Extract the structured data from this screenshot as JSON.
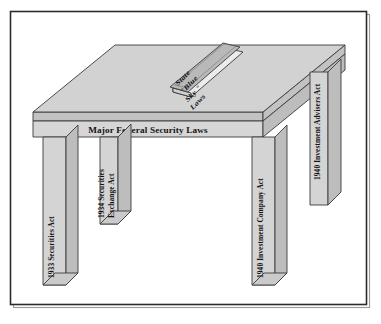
{
  "figure": {
    "title": "Major Federal Security Laws",
    "caption_on_apron": "Major Federal Security Laws",
    "book": {
      "name": "state-blue-sky-laws-book",
      "lines": [
        "State",
        "\"Blue",
        "Sky \"",
        "Laws"
      ],
      "full_text": "State \"Blue Sky\" Laws"
    },
    "legs": [
      {
        "id": "front-left-leg",
        "position": "front-left",
        "lines": [
          "1933 Securities Act"
        ],
        "full_text": "1933 Securities Act"
      },
      {
        "id": "back-left-leg",
        "position": "back-left",
        "lines": [
          "1934 Securities",
          "Exchange Act"
        ],
        "full_text": "1934 Securities Exchange Act"
      },
      {
        "id": "front-right-leg",
        "position": "front-right",
        "lines": [
          "1940 Investment Company Act"
        ],
        "full_text": "1940 Investment Company Act"
      },
      {
        "id": "back-right-leg",
        "position": "back-right",
        "lines": [
          "1940 Investment Advisers Act"
        ],
        "full_text": "1940 Investment Advisers Act"
      }
    ],
    "colors": {
      "frame_border": "#2b2b2b",
      "table_top": "#d2d2d2",
      "table_edge": "#c2c2c2",
      "apron": "#d6d6d6",
      "leg_front": "#d4d4d4",
      "leg_side": "#bdbdbd",
      "book_cover": "#b9b9b9",
      "book_pages": "#ececec",
      "text": "#141414",
      "background": "#ffffff"
    }
  }
}
